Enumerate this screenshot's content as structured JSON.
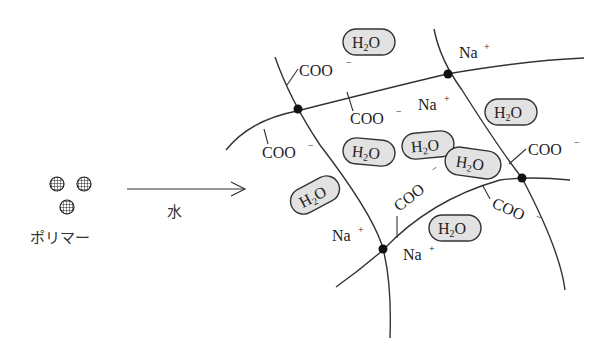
{
  "left": {
    "polymer_label": "ポリマー",
    "polymer_particle_count": 3,
    "arrow_label": "水"
  },
  "network": {
    "cross_links": 4,
    "water": {
      "formula_main": "H",
      "formula_sub": "2",
      "formula_end": "O",
      "count": 7
    },
    "carboxylate": {
      "text": "COO",
      "charge": "−",
      "count": 7
    },
    "sodium": {
      "text": "Na",
      "charge": "+",
      "count": 4
    }
  }
}
